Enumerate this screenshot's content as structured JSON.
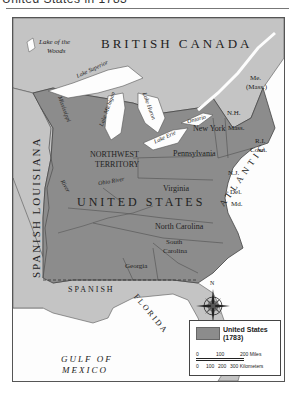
{
  "header": {
    "title": "United States in 1783"
  },
  "map": {
    "colors": {
      "united_states": "#8c8c8c",
      "foreign_territory": "#c4c4c4",
      "water": "#fdfdfd",
      "border": "#444444"
    },
    "regions": {
      "british_canada": "BRITISH CANADA",
      "spanish_louisiana": "SPANISH LOUISIANA",
      "spanish_florida": "SPANISH FLORIDA",
      "united_states": "UNITED STATES",
      "northwest_territory_line1": "NORTHWEST",
      "northwest_territory_line2": "TERRITORY"
    },
    "water_bodies": {
      "lake_of_the_woods_line1": "Lake of the",
      "lake_of_the_woods_line2": "Woods",
      "lake_superior": "Lake Superior",
      "lake_michigan": "Lake Michigan",
      "lake_huron": "Lake Huron",
      "lake_erie": "Lake Erie",
      "lake_ontario": "Ontario",
      "mississippi_river": "Mississippi",
      "river": "River",
      "ohio_river": "Ohio River",
      "atlantic_ocean_line1": "ATLANTIC",
      "atlantic_ocean_line2": "OCEAN",
      "gulf_of_mexico_line1": "GULF OF",
      "gulf_of_mexico_line2": "MEXICO"
    },
    "states": {
      "maine_line1": "Me.",
      "maine_line2": "(Mass.)",
      "new_hampshire": "N.H.",
      "massachusetts": "Mass.",
      "rhode_island": "R.I.",
      "connecticut": "Conn.",
      "new_york": "New York",
      "pennsylvania": "Pennsylvania",
      "new_jersey": "N.J.",
      "delaware": "Del.",
      "maryland": "Md.",
      "virginia": "Virginia",
      "north_carolina": "North Carolina",
      "south_carolina_line1": "South",
      "south_carolina_line2": "Carolina",
      "georgia": "Georgia"
    },
    "compass": {
      "north_label": "N"
    },
    "legend": {
      "label_line1": "United States",
      "label_line2": "(1783)",
      "miles_scale": [
        "0",
        "100",
        "200 Miles"
      ],
      "km_scale": [
        "0",
        "100",
        "200",
        "300 Kilometers"
      ]
    }
  }
}
